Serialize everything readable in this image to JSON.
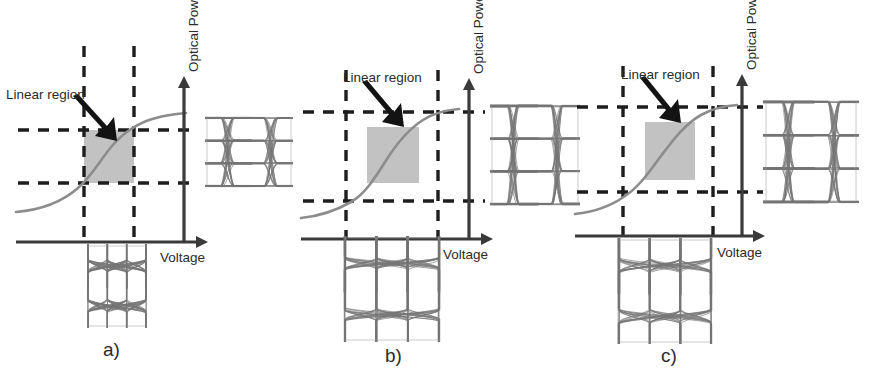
{
  "figure": {
    "colors": {
      "curve": "#8c8c8c",
      "axis": "#3a3a3a",
      "dashed": "#1d1d1d",
      "shaded_region": "#b9b9b9",
      "arrow": "#131313",
      "eye_trace": "#757575",
      "background": "#ffffff"
    }
  },
  "panels": [
    {
      "id": "a",
      "caption": "a)",
      "annotation_label": "Linear region",
      "y_axis_label": "Optical Power",
      "x_axis_label": "Voltage",
      "drive_swing": "small",
      "input_eye_label": "electrical PAM-4 input eye",
      "output_eye_label": "optical PAM-4 output eye",
      "input_eye_levels": 4,
      "output_eye_levels": 4,
      "linear_region_fit": "drive swing confined inside the linear region"
    },
    {
      "id": "b",
      "caption": "b)",
      "annotation_label": "Linear region",
      "y_axis_label": "Optical Power",
      "x_axis_label": "Voltage",
      "drive_swing": "large",
      "input_eye_label": "electrical PAM-4 input eye",
      "output_eye_label": "optical PAM-4 output eye",
      "input_eye_levels": 4,
      "output_eye_levels": 4,
      "linear_region_fit": "drive swing exceeds the linear region"
    },
    {
      "id": "c",
      "caption": "c)",
      "annotation_label": "Linear region",
      "y_axis_label": "Optical Power",
      "x_axis_label": "Voltage",
      "drive_swing": "large",
      "input_eye_label": "electrical PAM-4 input eye",
      "output_eye_label": "optical PAM-4 output eye",
      "input_eye_levels": 4,
      "output_eye_levels": 4,
      "linear_region_fit": "drive swing exceeds the linear region with pre-distorted levels"
    }
  ],
  "chart_data": {
    "type": "line",
    "xlabel": "Voltage",
    "ylabel": "Optical Power",
    "grid": false,
    "legend": "none",
    "xlim": [
      0,
      1
    ],
    "ylim": [
      0,
      1
    ],
    "series": [
      {
        "name": "a) transfer function",
        "x": [
          0.0,
          0.08,
          0.16,
          0.24,
          0.32,
          0.4,
          0.48,
          0.56,
          0.64,
          0.72,
          0.8,
          0.88,
          1.0
        ],
        "y": [
          0.04,
          0.06,
          0.09,
          0.13,
          0.19,
          0.28,
          0.4,
          0.53,
          0.65,
          0.75,
          0.82,
          0.87,
          0.91
        ]
      },
      {
        "name": "b) transfer function",
        "x": [
          0.0,
          0.08,
          0.16,
          0.24,
          0.32,
          0.4,
          0.48,
          0.56,
          0.64,
          0.72,
          0.8,
          0.88,
          1.0
        ],
        "y": [
          0.04,
          0.06,
          0.09,
          0.13,
          0.19,
          0.28,
          0.4,
          0.53,
          0.65,
          0.75,
          0.82,
          0.87,
          0.91
        ]
      },
      {
        "name": "c) transfer function",
        "x": [
          0.0,
          0.08,
          0.16,
          0.24,
          0.32,
          0.4,
          0.48,
          0.56,
          0.64,
          0.72,
          0.8,
          0.88,
          1.0
        ],
        "y": [
          0.04,
          0.06,
          0.09,
          0.13,
          0.19,
          0.28,
          0.4,
          0.53,
          0.65,
          0.75,
          0.82,
          0.87,
          0.91
        ]
      }
    ],
    "annotations": [
      {
        "panel": "a",
        "text": "Linear region",
        "points_to": "shaded linear region box"
      },
      {
        "panel": "b",
        "text": "Linear region",
        "points_to": "shaded linear region box"
      },
      {
        "panel": "c",
        "text": "Linear region",
        "points_to": "shaded linear region box"
      }
    ],
    "markers": {
      "a": {
        "v_low": 0.36,
        "v_high": 0.62,
        "p_low": 0.32,
        "p_high": 0.62
      },
      "b": {
        "v_low": 0.22,
        "v_high": 0.78,
        "p_low": 0.16,
        "p_high": 0.8
      },
      "c": {
        "v_low": 0.22,
        "v_high": 0.78,
        "p_low": 0.16,
        "p_high": 0.8
      }
    }
  }
}
